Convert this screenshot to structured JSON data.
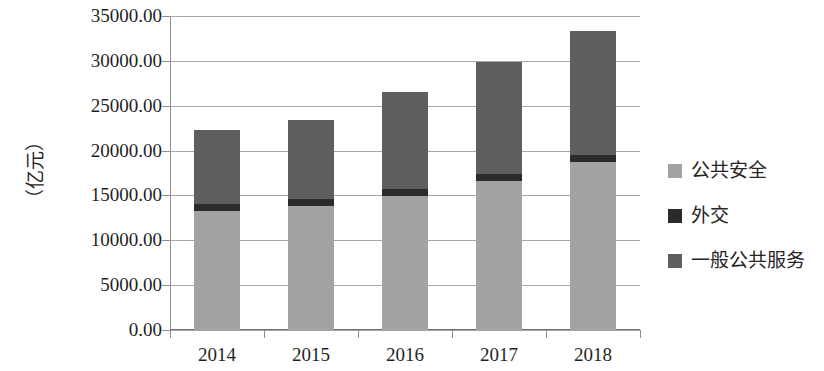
{
  "chart_data": {
    "type": "bar",
    "stacked": true,
    "title": "",
    "subtitle": "",
    "xlabel": "",
    "ylabel": "（亿元）",
    "categories": [
      "2014",
      "2015",
      "2016",
      "2017",
      "2018"
    ],
    "ylim": [
      0,
      35000
    ],
    "ytick_step": 5000,
    "ytick_labels": [
      "0.00",
      "5000.00",
      "10000.00",
      "15000.00",
      "20000.00",
      "25000.00",
      "30000.00",
      "35000.00"
    ],
    "ytick_values": [
      0,
      5000,
      10000,
      15000,
      20000,
      25000,
      30000,
      35000
    ],
    "grid": true,
    "grid_axis": "y",
    "legend_position": "right",
    "series": [
      {
        "name": "公共安全",
        "color": "#a3a3a3",
        "values": [
          13250,
          13800,
          14930,
          16590,
          18710
        ]
      },
      {
        "name": "外交",
        "color": "#2b2b2b",
        "values": [
          780,
          780,
          780,
          780,
          780
        ]
      },
      {
        "name": "一般公共服务",
        "color": "#5e5e5e",
        "values": [
          8240,
          8860,
          10790,
          12470,
          13810
        ]
      }
    ],
    "totals": [
      22270,
      23440,
      26500,
      29840,
      33300
    ],
    "legend_order": [
      "公共安全",
      "外交",
      "一般公共服务"
    ]
  }
}
